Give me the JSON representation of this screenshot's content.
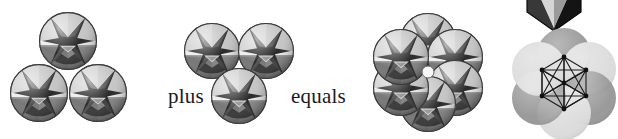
{
  "figure": {
    "name": "sphere-packing-equation-figure",
    "width": 618,
    "height": 139,
    "background": "#ffffff"
  },
  "labels": {
    "plus": "plus",
    "equals": "equals"
  },
  "palette": {
    "background": "#ffffff",
    "outline": "#3a3a3a",
    "sphere_light": "#c9c9c9",
    "sphere_midlight": "#a8a8a8",
    "sphere_mid": "#8d8d8d",
    "sphere_dark": "#565656",
    "sphere_black": "#1c1c1c",
    "sphere_highlight": "#f2f2f2",
    "flat_light": "#d9d9d9",
    "flat_dark": "#9a9a9a",
    "graph_line": "#1a1a1a",
    "graph_node": "#111111",
    "poly_light": "#c4c4c4",
    "poly_mid": "#8a8a8a",
    "poly_dark": "#2a2a2a",
    "poly_black": "#181818"
  },
  "groups": [
    {
      "name": "group-left-triad",
      "description": "three patterned spheres arranged as an upward triangle",
      "count": 3,
      "sphere_radius": 29,
      "spheres": [
        {
          "cx": 68,
          "cy": 41
        },
        {
          "cx": 39,
          "cy": 93
        },
        {
          "cx": 98,
          "cy": 93
        }
      ]
    },
    {
      "name": "group-middle-triad",
      "description": "three patterned spheres arranged as a downward triangle",
      "count": 3,
      "sphere_radius": 28,
      "spheres": [
        {
          "cx": 212,
          "cy": 51
        },
        {
          "cx": 266,
          "cy": 51
        },
        {
          "cx": 239,
          "cy": 96
        }
      ]
    },
    {
      "name": "group-hexagonal-cluster",
      "description": "six patterned spheres forming a hexagonal ring with a small white void at the centre",
      "count": 6,
      "sphere_radius": 28,
      "ring_center": {
        "cx": 428,
        "cy": 72
      },
      "ring_radius": 31,
      "spheres": [
        {
          "cx": 428,
          "cy": 41
        },
        {
          "cx": 455,
          "cy": 57
        },
        {
          "cx": 455,
          "cy": 88
        },
        {
          "cx": 428,
          "cy": 104
        },
        {
          "cx": 401,
          "cy": 88
        },
        {
          "cx": 401,
          "cy": 57
        }
      ]
    },
    {
      "name": "group-polyhedron-inset",
      "description": "dark faceted polyhedron cropped by the top edge of the figure",
      "count": 1,
      "center": {
        "cx": 554,
        "cy": 2
      }
    },
    {
      "name": "group-graph-overlay",
      "description": "six plain alternating grey circles in a hexagonal ring overlaid with a complete graph of seven nodes",
      "count": 6,
      "circle_radius": 27,
      "ring_center": {
        "cx": 564,
        "cy": 84
      },
      "ring_radius": 29,
      "circles": [
        {
          "cx": 564,
          "cy": 55,
          "tone": "flat_dark"
        },
        {
          "cx": 589,
          "cy": 69,
          "tone": "flat_light"
        },
        {
          "cx": 589,
          "cy": 98,
          "tone": "flat_dark"
        },
        {
          "cx": 564,
          "cy": 113,
          "tone": "flat_light"
        },
        {
          "cx": 539,
          "cy": 98,
          "tone": "flat_dark"
        },
        {
          "cx": 539,
          "cy": 69,
          "tone": "flat_light"
        }
      ],
      "graph": {
        "type": "complete-graph",
        "node_count": 7,
        "edge_count": 21,
        "nodes": [
          {
            "x": 564,
            "y": 57
          },
          {
            "x": 586,
            "y": 70
          },
          {
            "x": 586,
            "y": 96
          },
          {
            "x": 564,
            "y": 109
          },
          {
            "x": 542,
            "y": 96
          },
          {
            "x": 542,
            "y": 70
          },
          {
            "x": 564,
            "y": 83
          }
        ]
      }
    }
  ]
}
